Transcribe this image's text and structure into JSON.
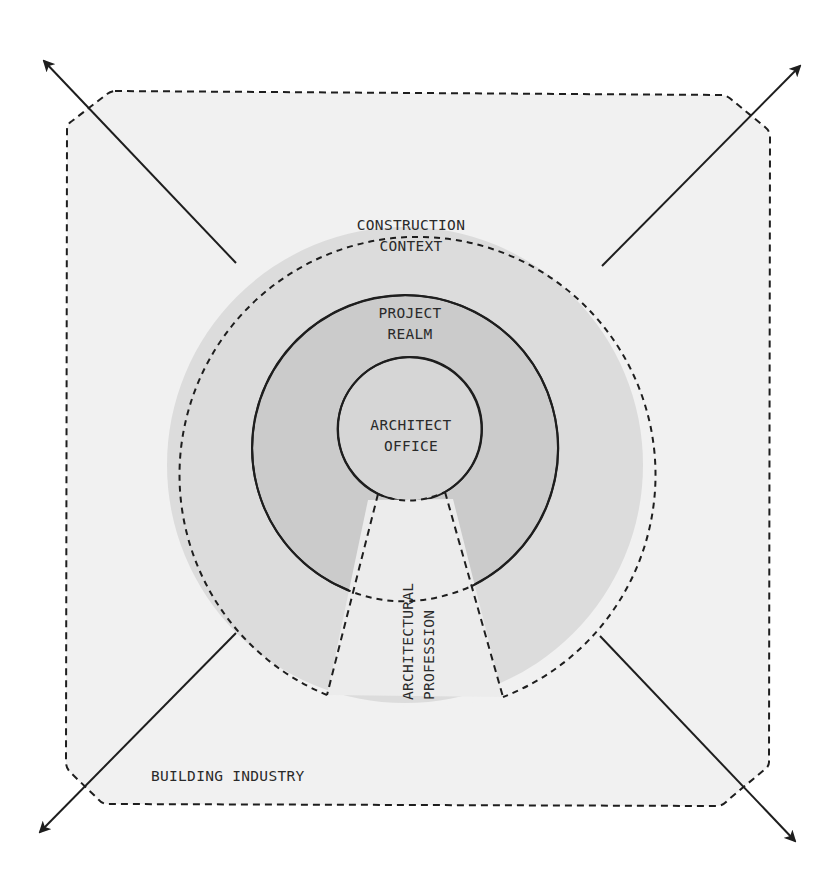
{
  "diagram": {
    "title": "",
    "colors": {
      "background": "#ffffff",
      "building_industry_fill": "#f1f1f1",
      "construction_context_fill": "#dcdcdc",
      "project_realm_fill": "#cbcbcb",
      "architect_office_fill": "#d6d6d6",
      "profession_fill": "#ececec",
      "stroke": "#1e1e1e"
    },
    "regions": {
      "building_industry": {
        "label": "BUILDING INDUSTRY",
        "border": "dashed"
      },
      "construction_context": {
        "line1": "CONSTRUCTION",
        "line2": "CONTEXT",
        "border": "dashed"
      },
      "project_realm": {
        "line1": "PROJECT",
        "line2": "REALM",
        "border": "solid"
      },
      "architect_office": {
        "line1": "ARCHITECT",
        "line2": "OFFICE",
        "border": "solid"
      },
      "architectural_profession": {
        "line1": "ARCHITECTURAL",
        "line2": "PROFESSION",
        "border": "dashed",
        "orientation": "vertical"
      }
    },
    "arrows": [
      {
        "name": "arrow-top-left",
        "direction": "outward"
      },
      {
        "name": "arrow-top-right",
        "direction": "outward"
      },
      {
        "name": "arrow-bottom-left",
        "direction": "outward"
      },
      {
        "name": "arrow-bottom-right",
        "direction": "outward"
      }
    ]
  }
}
